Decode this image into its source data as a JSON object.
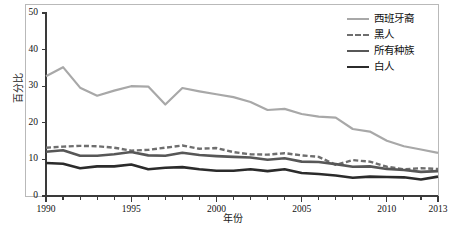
{
  "chart_data": {
    "type": "line",
    "title": "",
    "xlabel": "年份",
    "ylabel": "百分比",
    "xlim": [
      1990,
      2013
    ],
    "ylim": [
      0,
      50
    ],
    "ytick_values": [
      0,
      10,
      20,
      30,
      40,
      50
    ],
    "ytick_labels": [
      "0",
      "10",
      "20",
      "30",
      "40",
      "50"
    ],
    "xtick_values": [
      1990,
      1995,
      2000,
      2005,
      2010,
      2013
    ],
    "xtick_labels": [
      "1990",
      "1995",
      "2000",
      "2005",
      "2010",
      "2013"
    ],
    "minor_xticks_every": 1,
    "grid": false,
    "legend_position": "top-right",
    "x": [
      1990,
      1991,
      1992,
      1993,
      1994,
      1995,
      1996,
      1997,
      1998,
      1999,
      2000,
      2001,
      2002,
      2003,
      2004,
      2005,
      2006,
      2007,
      2008,
      2009,
      2010,
      2011,
      2012,
      2013
    ],
    "series": [
      {
        "name": "西班牙裔",
        "color": "#a8a8a8",
        "style": "solid",
        "width": 2.2,
        "values": [
          32.7,
          35.2,
          29.6,
          27.4,
          28.8,
          30.0,
          29.9,
          25.0,
          29.5,
          28.6,
          27.8,
          27.0,
          25.7,
          23.5,
          23.8,
          22.4,
          21.7,
          21.4,
          18.3,
          17.6,
          15.1,
          13.6,
          12.7,
          11.8
        ]
      },
      {
        "name": "黑人",
        "color": "#6e6e6e",
        "style": "dashed",
        "width": 2.4,
        "values": [
          13.2,
          13.5,
          13.7,
          13.6,
          13.2,
          12.4,
          12.6,
          13.2,
          13.8,
          12.9,
          13.1,
          12.0,
          11.4,
          11.3,
          11.7,
          11.1,
          10.7,
          8.5,
          9.8,
          9.4,
          8.0,
          7.3,
          7.6,
          7.4
        ]
      },
      {
        "name": "所有种族",
        "color": "#575757",
        "style": "solid",
        "width": 2.6,
        "values": [
          12.1,
          12.5,
          11.0,
          11.0,
          11.4,
          12.0,
          11.1,
          11.0,
          11.8,
          11.2,
          10.9,
          10.7,
          10.5,
          9.9,
          10.3,
          9.4,
          9.3,
          8.7,
          8.0,
          8.1,
          7.4,
          7.1,
          6.6,
          6.8
        ]
      },
      {
        "name": "白人",
        "color": "#2b2b2b",
        "style": "solid",
        "width": 2.6,
        "values": [
          9.0,
          8.8,
          7.6,
          8.1,
          8.1,
          8.6,
          7.3,
          7.7,
          7.9,
          7.3,
          6.9,
          6.9,
          7.3,
          6.8,
          7.3,
          6.3,
          6.0,
          5.6,
          5.0,
          5.3,
          5.2,
          5.1,
          4.5,
          5.3
        ]
      }
    ]
  },
  "legend": {
    "items": [
      {
        "label": "西班牙裔"
      },
      {
        "label": "黑人"
      },
      {
        "label": "所有种族"
      },
      {
        "label": "白人"
      }
    ]
  }
}
